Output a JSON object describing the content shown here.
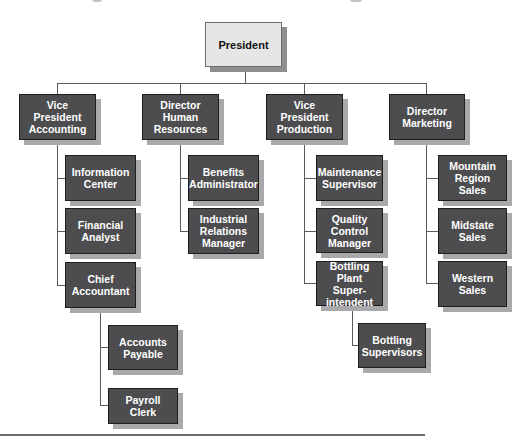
{
  "chart": {
    "title": "",
    "root": {
      "label": "President"
    },
    "level1": [
      {
        "label": "Vice President\nAccounting",
        "children": [
          {
            "label": "Information\nCenter"
          },
          {
            "label": "Financial\nAnalyst"
          },
          {
            "label": "Chief\nAccountant",
            "children": [
              {
                "label": "Accounts\nPayable"
              },
              {
                "label": "Payroll Clerk"
              }
            ]
          }
        ]
      },
      {
        "label": "Director\nHuman\nResources",
        "children": [
          {
            "label": "Benefits\nAdministrator"
          },
          {
            "label": "Industrial\nRelations\nManager"
          }
        ]
      },
      {
        "label": "Vice President\nProduction",
        "children": [
          {
            "label": "Maintenance\nSupervisor"
          },
          {
            "label": "Quality\nControl\nManager"
          },
          {
            "label": "Bottling Plant\nSuper-\nintendent",
            "children": [
              {
                "label": "Bottling\nSupervisors"
              }
            ]
          }
        ]
      },
      {
        "label": "Director\nMarketing",
        "children": [
          {
            "label": "Mountain\nRegion Sales"
          },
          {
            "label": "Midstate\nSales"
          },
          {
            "label": "Western\nSales"
          }
        ]
      }
    ]
  },
  "colors": {
    "box_fill": "#4d4d4f",
    "box_shadow": "#a9a9ab",
    "root_fill": "#e6e6e6",
    "connector": "#5a5a5a",
    "text_on_dark": "#ffffff",
    "text_on_light": "#111111"
  }
}
